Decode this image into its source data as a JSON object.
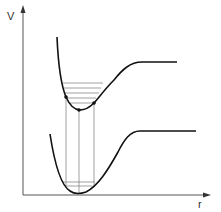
{
  "diagram": {
    "y_axis_label": "V",
    "x_axis_label": "r",
    "curves": [
      {
        "name": "ground-state-potential",
        "color": "#111111"
      },
      {
        "name": "excited-state-potential",
        "color": "#111111"
      }
    ],
    "vibrational_levels_upper": 5,
    "vibrational_levels_lower": 1,
    "vertical_transitions": 3,
    "colors": {
      "curve": "#111111",
      "axis": "#555555",
      "levels": "#888888"
    }
  }
}
